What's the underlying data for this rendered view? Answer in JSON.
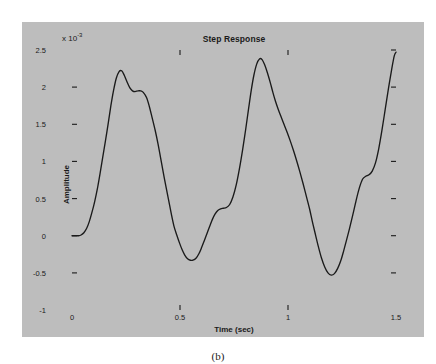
{
  "figure": {
    "caption_a": "(a)",
    "caption_b": "(b)",
    "panel_color": "#bdbdbd",
    "plot_bg": "#ffffff",
    "axis_color": "#1a1a1a",
    "curve_color": "#1a1a1a"
  },
  "chart_data": {
    "type": "line",
    "title": "Step Response",
    "xlabel": "Time (sec)",
    "ylabel": "Amplitude",
    "y_exponent_prefix": "x 10",
    "y_exponent": "-3",
    "y_scale_note": "x 10^-3",
    "xlim": [
      0,
      1.5
    ],
    "ylim": [
      -1,
      2.5
    ],
    "xticks": [
      0,
      0.5,
      1,
      1.5
    ],
    "xtick_labels": [
      "0",
      "0.5",
      "1",
      "1.5"
    ],
    "yticks": [
      -1,
      -0.5,
      0,
      0.5,
      1,
      1.5,
      2,
      2.5
    ],
    "ytick_labels": [
      "-1",
      "-0.5",
      "0",
      "0.5",
      "1",
      "1.5",
      "2",
      "2.5"
    ],
    "grid": false,
    "legend": false,
    "series": [
      {
        "name": "step response",
        "x": [
          0.0,
          0.015,
          0.03,
          0.042,
          0.055,
          0.068,
          0.08,
          0.092,
          0.105,
          0.118,
          0.13,
          0.142,
          0.155,
          0.168,
          0.18,
          0.192,
          0.205,
          0.218,
          0.23,
          0.242,
          0.255,
          0.268,
          0.28,
          0.292,
          0.305,
          0.318,
          0.33,
          0.345,
          0.358,
          0.37,
          0.385,
          0.398,
          0.41,
          0.422,
          0.435,
          0.448,
          0.46,
          0.472,
          0.485,
          0.498,
          0.51,
          0.522,
          0.535,
          0.548,
          0.56,
          0.575,
          0.588,
          0.6,
          0.612,
          0.625,
          0.638,
          0.65,
          0.662,
          0.675,
          0.688,
          0.7,
          0.715,
          0.73,
          0.745,
          0.76,
          0.775,
          0.79,
          0.805,
          0.818,
          0.83,
          0.842,
          0.855,
          0.868,
          0.88,
          0.892,
          0.905,
          0.918,
          0.93,
          0.942,
          0.955,
          0.968,
          0.98,
          0.995,
          1.01,
          1.025,
          1.04,
          1.055,
          1.07,
          1.085,
          1.1,
          1.112,
          1.125,
          1.14,
          1.155,
          1.17,
          1.185,
          1.2,
          1.215,
          1.23,
          1.245,
          1.258,
          1.27,
          1.285,
          1.3,
          1.315,
          1.33,
          1.345,
          1.36,
          1.375,
          1.39,
          1.405,
          1.42,
          1.435,
          1.45,
          1.465,
          1.48,
          1.492,
          1.5
        ],
        "y": [
          0.0,
          0.0,
          0.0,
          0.01,
          0.04,
          0.1,
          0.19,
          0.31,
          0.46,
          0.64,
          0.84,
          1.05,
          1.28,
          1.52,
          1.75,
          1.95,
          2.12,
          2.21,
          2.22,
          2.16,
          2.07,
          1.99,
          1.95,
          1.94,
          1.95,
          1.95,
          1.93,
          1.86,
          1.74,
          1.6,
          1.42,
          1.24,
          1.05,
          0.86,
          0.66,
          0.47,
          0.29,
          0.13,
          0.01,
          -0.1,
          -0.19,
          -0.26,
          -0.31,
          -0.33,
          -0.33,
          -0.3,
          -0.24,
          -0.16,
          -0.07,
          0.03,
          0.13,
          0.22,
          0.29,
          0.34,
          0.36,
          0.37,
          0.38,
          0.42,
          0.52,
          0.68,
          0.9,
          1.16,
          1.45,
          1.72,
          1.96,
          2.16,
          2.31,
          2.38,
          2.37,
          2.3,
          2.19,
          2.06,
          1.93,
          1.81,
          1.7,
          1.6,
          1.51,
          1.4,
          1.28,
          1.15,
          1.01,
          0.86,
          0.7,
          0.53,
          0.36,
          0.2,
          0.04,
          -0.14,
          -0.3,
          -0.42,
          -0.5,
          -0.53,
          -0.51,
          -0.44,
          -0.33,
          -0.2,
          -0.07,
          0.1,
          0.28,
          0.47,
          0.64,
          0.76,
          0.8,
          0.82,
          0.87,
          0.98,
          1.17,
          1.42,
          1.7,
          1.98,
          2.24,
          2.42,
          2.47
        ],
        "note_segments": [
          {
            "label": "initial flat at zero",
            "t_range": [
              0.0,
              0.04
            ],
            "value": 0.0
          },
          {
            "label": "first peak",
            "t": 0.175,
            "value": 2.22
          },
          {
            "label": "shoulder after first peak",
            "t": 0.28,
            "value": 1.95
          },
          {
            "label": "first trough",
            "t": 0.42,
            "value": -0.33
          },
          {
            "label": "shoulder on second rise",
            "t": 0.52,
            "value": 0.37
          },
          {
            "label": "second peak",
            "t": 0.645,
            "value": 2.38
          },
          {
            "label": "shoulder on second decay",
            "t": 0.8,
            "value": 1.5
          },
          {
            "label": "second trough",
            "t": 0.885,
            "value": -0.53
          },
          {
            "label": "third peak",
            "t": 1.115,
            "value": 2.47
          },
          {
            "label": "shoulder on third decay",
            "t": 1.245,
            "value": 0.82
          },
          {
            "label": "third trough",
            "t": 1.345,
            "value": -0.47
          },
          {
            "label": "right edge endpoint",
            "t": 1.5,
            "value": 1.55
          }
        ]
      }
    ]
  }
}
